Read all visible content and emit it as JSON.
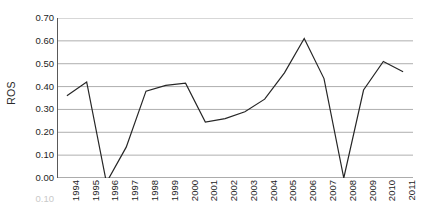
{
  "chart_data": {
    "type": "line",
    "title": "",
    "xlabel": "",
    "ylabel": "ROS",
    "ylim": [
      0.0,
      0.7
    ],
    "ytick_labels": [
      "0.70",
      "0.60",
      "0.50",
      "0.40",
      "0.30",
      "0.20",
      "0.10",
      "0.00"
    ],
    "ytick_values": [
      0.7,
      0.6,
      0.5,
      0.4,
      0.3,
      0.2,
      0.1,
      0.0
    ],
    "grid": "horizontal",
    "legend": "none",
    "markers": "none",
    "line_color": "#262626",
    "background_color": "#ffffff",
    "gridline_color": "#a6a6a6",
    "axis_color": "#595959",
    "artifact_label": "0.10",
    "categories": [
      "1994",
      "1995",
      "1996",
      "1997",
      "1998",
      "1999",
      "2000",
      "2001",
      "2002",
      "2003",
      "2004",
      "2005",
      "2006",
      "2007",
      "2008",
      "2009",
      "2010",
      "2011"
    ],
    "series": [
      {
        "name": "ROS",
        "values": [
          0.36,
          0.42,
          -0.02,
          0.135,
          0.38,
          0.405,
          0.415,
          0.245,
          0.26,
          0.29,
          0.345,
          0.46,
          0.61,
          0.435,
          0.0,
          0.385,
          0.51,
          0.465
        ]
      }
    ]
  }
}
